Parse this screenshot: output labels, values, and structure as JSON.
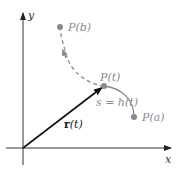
{
  "figure": {
    "axes": {
      "x_label": "x",
      "y_label": "y"
    },
    "points": {
      "P_b": {
        "label": "P(b)"
      },
      "P_t": {
        "label": "P(t)"
      },
      "P_a": {
        "label": "P(a)"
      }
    },
    "arc_label": "s = h(t)",
    "vector_label_bold": "r",
    "vector_label_rest": "(t)",
    "colors": {
      "axis": "#333333",
      "vector": "#111111",
      "curve": "#8a8a8a",
      "point": "#8a8a8a"
    }
  }
}
